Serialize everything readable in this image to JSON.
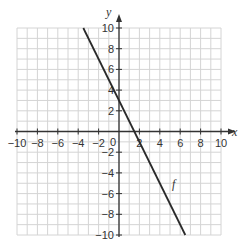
{
  "chart_data": {
    "type": "line",
    "title": "",
    "xlabel": "x",
    "ylabel": "y",
    "xlim": [
      -10,
      10
    ],
    "ylim": [
      -10,
      10
    ],
    "grid": true,
    "grid_step": 1,
    "x_ticks": [
      -10,
      -8,
      -6,
      -4,
      -2,
      0,
      2,
      4,
      6,
      8,
      10
    ],
    "y_ticks": [
      -10,
      -8,
      -6,
      -4,
      -2,
      2,
      4,
      6,
      8,
      10
    ],
    "origin_label": "0",
    "series": [
      {
        "name": "f",
        "equation": "y = -2x + 3",
        "slope": -2,
        "intercept": 3,
        "points": [
          [
            -3.5,
            10
          ],
          [
            6.5,
            -10
          ]
        ],
        "label_position": [
          4.8,
          -5.5
        ]
      }
    ],
    "legend": "none"
  },
  "style": {
    "grid_color": "#d4d4d4",
    "axis_color": "#333333",
    "line_color": "#2a2a2a"
  }
}
